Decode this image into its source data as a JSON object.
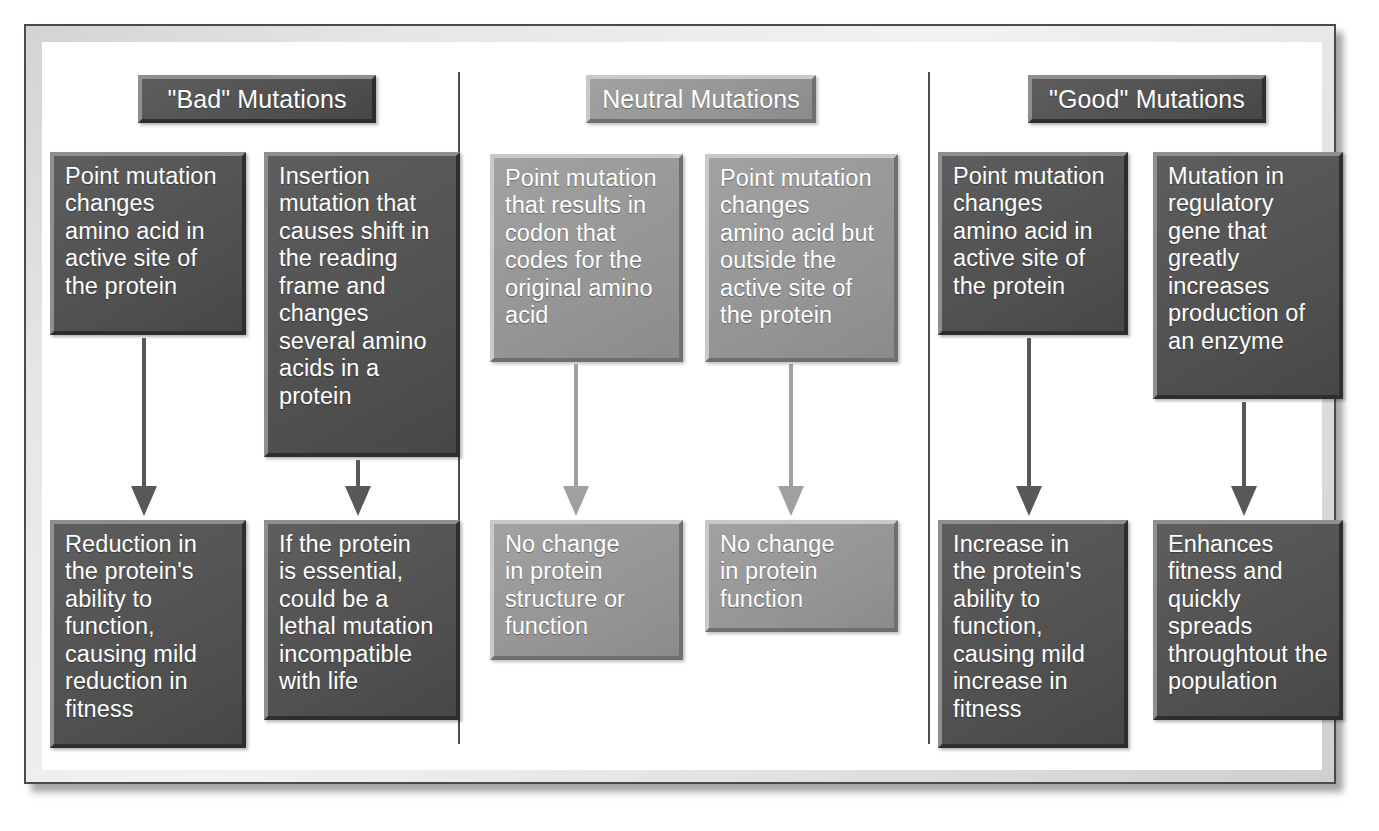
{
  "diagram": {
    "title_hidden": "",
    "columns": [
      {
        "id": "bad",
        "header": "\"Bad\" Mutations",
        "tone": "dark",
        "causes": [
          "Point mutation\nchanges\namino acid in\nactive site of\nthe protein",
          "Insertion\nmutation that\ncauses shift in\nthe reading\nframe and\nchanges\nseveral amino\nacids in a\nprotein"
        ],
        "effects": [
          "Reduction in\nthe protein's\nability to\nfunction,\ncausing mild\nreduction in\nfitness",
          "If the protein\nis essential,\ncould be a\nlethal mutation\nincompatible\nwith life"
        ]
      },
      {
        "id": "neutral",
        "header": "Neutral Mutations",
        "tone": "mid",
        "causes": [
          "Point mutation\nthat results in\ncodon that\ncodes for the\noriginal amino\nacid",
          "Point mutation\nchanges\namino acid but\noutside the\nactive site of\nthe protein"
        ],
        "effects": [
          "No change\nin protein\nstructure or\nfunction",
          "No change\nin protein\nfunction"
        ]
      },
      {
        "id": "good",
        "header": "\"Good\" Mutations",
        "tone": "dark",
        "causes": [
          "Point mutation\nchanges\namino acid in\nactive site of\nthe protein",
          "Mutation in\nregulatory\ngene that\ngreatly\nincreases\nproduction of\nan enzyme"
        ],
        "effects": [
          "Increase in\nthe protein's\nability to\nfunction,\ncausing mild\nincrease in\nfitness",
          "Enhances\nfitness and\nquickly\nspreads\nthroughtout the\npopulation"
        ]
      }
    ],
    "colors": {
      "frame_border": "#4a4a4a",
      "divider": "#4d4d4d",
      "box_dark": "#545454",
      "box_mid": "#979797",
      "arrow_dark": "#585858",
      "arrow_mid": "#a0a0a0",
      "box_text": "#ffffff",
      "canvas": "#ffffff"
    }
  }
}
